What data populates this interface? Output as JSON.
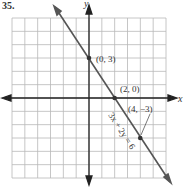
{
  "problem_number": "35.",
  "chart_data": {
    "type": "line",
    "title": "",
    "xlabel": "x",
    "ylabel": "y",
    "xlim": [
      -6,
      6
    ],
    "ylim": [
      -6,
      6
    ],
    "grid": true,
    "series": [
      {
        "name": "3x + 2y = 6",
        "equation": "3x + 2y = 6",
        "x": [
          -2,
          0,
          2,
          4,
          6
        ],
        "y": [
          6,
          3,
          0,
          -3,
          -6
        ]
      }
    ],
    "points": [
      {
        "label": "(0, 3)",
        "x": 0,
        "y": 3
      },
      {
        "label": "(2, 0)",
        "x": 2,
        "y": 0
      },
      {
        "label": "(4, −3)",
        "x": 4,
        "y": -3
      }
    ],
    "annotations": [
      "3x + 2y = 6"
    ]
  },
  "labels": {
    "x_axis": "x",
    "y_axis": "y",
    "p1": "(0, 3)",
    "p2": "(2, 0)",
    "p3": "(4, −3)",
    "equation": "3x + 2y = 6"
  }
}
